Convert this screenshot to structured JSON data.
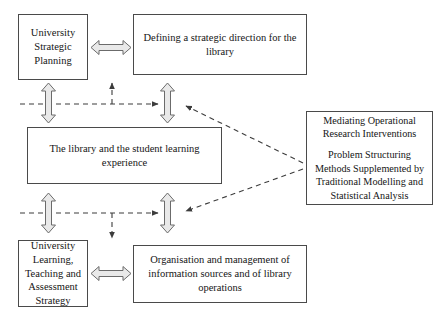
{
  "diagram": {
    "background_color": "#ffffff",
    "box_border_color": "#4a4a4a",
    "arrow_fill_color": "#e9e9e9",
    "arrow_stroke_color": "#6b6b6b",
    "dashed_line_color": "#3c3c3c",
    "boxes": {
      "strategic_planning": {
        "line1": "University",
        "line2": "Strategic",
        "line3": "Planning"
      },
      "strategic_direction": {
        "line1": "Defining a strategic direction for the",
        "line2": "library"
      },
      "library_student": {
        "line1": "The library and the student learning",
        "line2": "experience"
      },
      "learning_teaching": {
        "line1": "University",
        "line2": "Learning,",
        "line3": "Teaching and",
        "line4": "Assessment",
        "line5": "Strategy"
      },
      "organisation": {
        "line1": "Organisation and management of",
        "line2": "information sources and of library",
        "line3": "operations"
      },
      "mediating_or": {
        "line1": "Mediating Operational",
        "line2": "Research Interventions",
        "line3": "Problem Structuring",
        "line4": "Methods Supplemented by",
        "line5": "Traditional Modelling and",
        "line6": "Statistical Analysis"
      }
    },
    "connectors": {
      "top_horizontal_double_arrow": "University Strategic Planning ↔ Defining a strategic direction for the library",
      "left_vertical_double_arrow_upper": "University Strategic Planning ↔ The library and the student learning experience",
      "left_vertical_double_arrow_lower": "The library and the student learning experience ↔ University Learning, Teaching and Assessment Strategy",
      "right_vertical_double_arrow_upper": "Defining a strategic direction for the library ↔ The library and the student learning experience",
      "right_vertical_double_arrow_lower": "The library and the student learning experience ↔ Organisation and management of information sources and of library operations",
      "bottom_horizontal_double_arrow": "University Learning, Teaching and Assessment Strategy ↔ Organisation and management of information sources and of library operations",
      "dashed_upper_horizontal": "dashed arrow pointing right, above the central box",
      "dashed_lower_horizontal": "dashed arrow pointing right, below the central box",
      "dashed_upper_vertical": "dashed arrow pointing up toward the strategic direction box",
      "dashed_lower_vertical": "dashed arrow pointing down toward the organisation box",
      "dashed_diagonal_upper": "dashed arrow from Mediating Operational Research Interventions up-left to the central crossing point",
      "dashed_diagonal_lower": "dashed arrow from Mediating Operational Research Interventions down-left to the lower crossing point"
    }
  }
}
